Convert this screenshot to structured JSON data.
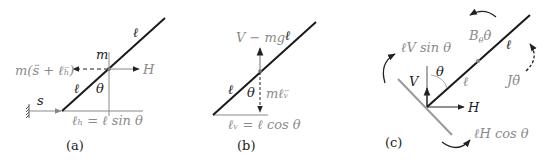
{
  "figure": {
    "panels": [
      {
        "id": "a",
        "caption": "(a)",
        "labels": {
          "rod_top": "ℓ",
          "rod_bottom": "ℓ",
          "mass": "m",
          "angle": "θ",
          "inertial_force": "m(s̈ + ℓ̈ₕ)",
          "horizontal_force": "H",
          "displacement": "s",
          "horizontal_projection": "ℓₕ = ℓ sin θ"
        }
      },
      {
        "id": "b",
        "caption": "(b)",
        "labels": {
          "rod_top": "ℓ",
          "rod_bottom": "ℓ",
          "angle": "θ",
          "vertical_force": "V − mg",
          "inertial_force": "mℓ̈ᵥ",
          "vertical_projection": "ℓᵥ = ℓ cos θ"
        }
      },
      {
        "id": "c",
        "caption": "(c)",
        "labels": {
          "moment_v": "ℓV sin θ",
          "damping": "B",
          "damping_sub": "θ",
          "damping_rate": "θ̇",
          "rod_top": "ℓ",
          "rod_bottom": "ℓ",
          "inertia_moment": "Jθ̈",
          "angle": "θ",
          "vertical_force": "V",
          "horizontal_force": "H",
          "moment_h": "ℓH cos θ"
        }
      }
    ],
    "colors": {
      "rod": "#1a1a1a",
      "guide": "#8a8a8a",
      "label_gray": "#8a8a8a",
      "label_dark": "#222222"
    }
  }
}
